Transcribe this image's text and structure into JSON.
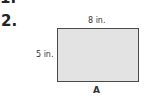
{
  "previous_item": {
    "number_fragment": "1."
  },
  "problem": {
    "number": "2.",
    "figure": {
      "shape": "rectangle",
      "fill_color": "#e3e3e3",
      "border_color": "#4a4a4a",
      "labels": {
        "top": "8 in.",
        "left": "5 in.",
        "bottom": "A"
      }
    }
  }
}
